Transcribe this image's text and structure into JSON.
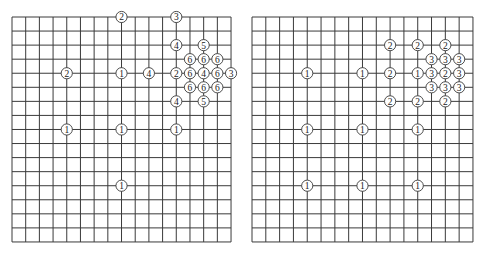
{
  "style": {
    "line_color": "#3a3a3a",
    "stone_fill": "#ffffff",
    "stone_stroke": "#3a3a3a",
    "text_color": "#222222",
    "background": "#ffffff"
  },
  "boards": [
    {
      "id": "left",
      "origin_x": 12,
      "origin_y": 17,
      "cols": 16,
      "rows": 16,
      "cell_w": 13.69,
      "cell_h": 14.06,
      "markers": [
        {
          "col": 8,
          "row": 0,
          "label": "2"
        },
        {
          "col": 12,
          "row": 0,
          "label": "3"
        },
        {
          "col": 12,
          "row": 2,
          "label": "4"
        },
        {
          "col": 14,
          "row": 2,
          "label": "5"
        },
        {
          "col": 13,
          "row": 3,
          "label": "6"
        },
        {
          "col": 14,
          "row": 3,
          "label": "6"
        },
        {
          "col": 15,
          "row": 3,
          "label": "6"
        },
        {
          "col": 4,
          "row": 4,
          "label": "2"
        },
        {
          "col": 8,
          "row": 4,
          "label": "1"
        },
        {
          "col": 10,
          "row": 4,
          "label": "4"
        },
        {
          "col": 12,
          "row": 4,
          "label": "2"
        },
        {
          "col": 13,
          "row": 4,
          "label": "6"
        },
        {
          "col": 14,
          "row": 4,
          "label": "4"
        },
        {
          "col": 15,
          "row": 4,
          "label": "6"
        },
        {
          "col": 16,
          "row": 4,
          "label": "3"
        },
        {
          "col": 13,
          "row": 5,
          "label": "6"
        },
        {
          "col": 14,
          "row": 5,
          "label": "6"
        },
        {
          "col": 15,
          "row": 5,
          "label": "6"
        },
        {
          "col": 12,
          "row": 6,
          "label": "4"
        },
        {
          "col": 14,
          "row": 6,
          "label": "5"
        },
        {
          "col": 4,
          "row": 8,
          "label": "1"
        },
        {
          "col": 8,
          "row": 8,
          "label": "1"
        },
        {
          "col": 12,
          "row": 8,
          "label": "1"
        },
        {
          "col": 8,
          "row": 12,
          "label": "1"
        }
      ]
    },
    {
      "id": "right",
      "origin_x": 12,
      "origin_y": 17,
      "cols": 16,
      "rows": 16,
      "cell_w": 13.81,
      "cell_h": 14.06,
      "markers": [
        {
          "col": 10,
          "row": 2,
          "label": "2"
        },
        {
          "col": 12,
          "row": 2,
          "label": "2"
        },
        {
          "col": 14,
          "row": 2,
          "label": "2"
        },
        {
          "col": 13,
          "row": 3,
          "label": "3"
        },
        {
          "col": 14,
          "row": 3,
          "label": "3"
        },
        {
          "col": 15,
          "row": 3,
          "label": "3"
        },
        {
          "col": 4,
          "row": 4,
          "label": "1"
        },
        {
          "col": 8,
          "row": 4,
          "label": "1"
        },
        {
          "col": 10,
          "row": 4,
          "label": "2"
        },
        {
          "col": 12,
          "row": 4,
          "label": "1"
        },
        {
          "col": 13,
          "row": 4,
          "label": "3"
        },
        {
          "col": 14,
          "row": 4,
          "label": "2"
        },
        {
          "col": 15,
          "row": 4,
          "label": "3"
        },
        {
          "col": 13,
          "row": 5,
          "label": "3"
        },
        {
          "col": 14,
          "row": 5,
          "label": "3"
        },
        {
          "col": 15,
          "row": 5,
          "label": "3"
        },
        {
          "col": 10,
          "row": 6,
          "label": "2"
        },
        {
          "col": 12,
          "row": 6,
          "label": "2"
        },
        {
          "col": 14,
          "row": 6,
          "label": "2"
        },
        {
          "col": 4,
          "row": 8,
          "label": "1"
        },
        {
          "col": 8,
          "row": 8,
          "label": "1"
        },
        {
          "col": 12,
          "row": 8,
          "label": "1"
        },
        {
          "col": 4,
          "row": 12,
          "label": "1"
        },
        {
          "col": 8,
          "row": 12,
          "label": "1"
        },
        {
          "col": 12,
          "row": 12,
          "label": "1"
        }
      ]
    }
  ]
}
